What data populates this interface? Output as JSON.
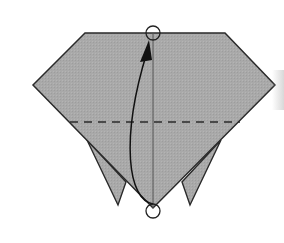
{
  "diagram": {
    "title": "Origami fold step",
    "colors": {
      "paper": "#a9a9a9",
      "outline": "#2a2a2a",
      "crease": "#555555",
      "arrow": "#111111",
      "background": "#ffffff"
    },
    "shape": {
      "body_points": "85,33 225,33 275,85 153,208 33,85",
      "left_flap_points": "87,140 118,205 126,182",
      "right_flap_points": "221,140 190,205 182,182"
    },
    "valley_fold_line": {
      "x1": 70,
      "y1": 122,
      "x2": 240,
      "y2": 122,
      "dash": "8,6"
    },
    "center_crease": {
      "x1": 153,
      "y1": 33,
      "x2": 153,
      "y2": 208
    },
    "markers": [
      {
        "name": "top-target",
        "cx": 153,
        "cy": 33,
        "r": 7
      },
      {
        "name": "bottom-source",
        "cx": 153,
        "cy": 211,
        "r": 7
      }
    ],
    "arrow": {
      "path": "M 153 204 C 128 200, 120 140, 147 52",
      "head_points": "149,40 140,62 152,60"
    }
  }
}
